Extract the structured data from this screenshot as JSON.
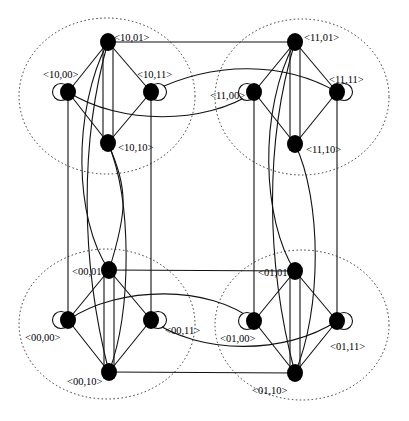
{
  "diagram": {
    "type": "hierarchical graph / hypercube-like network of 4 clusters",
    "colors": {
      "node": "#000000",
      "edge": "#111111",
      "cluster_boundary": "#333333",
      "background": "#ffffff"
    },
    "clusters": [
      {
        "id": "10",
        "position": "top-left",
        "cx": 107,
        "cy": 96,
        "rx": 88,
        "ry": 78
      },
      {
        "id": "11",
        "position": "top-right",
        "cx": 302,
        "cy": 97,
        "rx": 87,
        "ry": 78
      },
      {
        "id": "00",
        "position": "bottom-left",
        "cx": 107,
        "cy": 324,
        "rx": 88,
        "ry": 75
      },
      {
        "id": "01",
        "position": "bottom-right",
        "cx": 302,
        "cy": 325,
        "rx": 87,
        "ry": 75
      }
    ],
    "nodes": [
      {
        "id": "10,01",
        "label": "<10,01>",
        "x": 108,
        "y": 42,
        "lx": 114,
        "ly": 37,
        "loop": null
      },
      {
        "id": "10,00",
        "label": "<10,00>",
        "x": 68,
        "y": 92,
        "lx": 43,
        "ly": 74,
        "loop": "left"
      },
      {
        "id": "10,11",
        "label": "<10,11>",
        "x": 151,
        "y": 92,
        "lx": 137,
        "ly": 74,
        "loop": "right"
      },
      {
        "id": "10,10",
        "label": "<10,10>",
        "x": 108,
        "y": 143,
        "lx": 118,
        "ly": 147,
        "loop": null
      },
      {
        "id": "11,01",
        "label": "<11,01>",
        "x": 295,
        "y": 42,
        "lx": 304,
        "ly": 37,
        "loop": null
      },
      {
        "id": "11,00",
        "label": "<11,00>",
        "x": 254,
        "y": 92,
        "lx": 210,
        "ly": 95,
        "loop": "left"
      },
      {
        "id": "11,11",
        "label": "<11,11>",
        "x": 337,
        "y": 92,
        "lx": 329,
        "ly": 79,
        "loop": "right"
      },
      {
        "id": "11,10",
        "label": "<11,10>",
        "x": 295,
        "y": 144,
        "lx": 306,
        "ly": 149,
        "loop": null
      },
      {
        "id": "00,01",
        "label": "<00,01>",
        "x": 109,
        "y": 270,
        "lx": 72,
        "ly": 271,
        "loop": null
      },
      {
        "id": "00,00",
        "label": "<00,00>",
        "x": 68,
        "y": 320,
        "lx": 25,
        "ly": 337,
        "loop": "left"
      },
      {
        "id": "00,11",
        "label": "<00,11>",
        "x": 151,
        "y": 320,
        "lx": 165,
        "ly": 330,
        "loop": "right"
      },
      {
        "id": "00,10",
        "label": "<00,10>",
        "x": 109,
        "y": 372,
        "lx": 67,
        "ly": 381,
        "loop": null
      },
      {
        "id": "01,01",
        "label": "<01,01>",
        "x": 295,
        "y": 271,
        "lx": 258,
        "ly": 272,
        "loop": null
      },
      {
        "id": "01,00",
        "label": "<01,00>",
        "x": 254,
        "y": 321,
        "lx": 220,
        "ly": 338,
        "loop": "left"
      },
      {
        "id": "01,11",
        "label": "<01,11>",
        "x": 337,
        "y": 321,
        "lx": 330,
        "ly": 346,
        "loop": "right"
      },
      {
        "id": "01,10",
        "label": "<01,10>",
        "x": 295,
        "y": 373,
        "lx": 252,
        "ly": 390,
        "loop": null
      }
    ],
    "edges": [
      {
        "from": "10,01",
        "to": "10,00",
        "d": "M108,42 L68,92"
      },
      {
        "from": "10,01",
        "to": "10,11",
        "d": "M108,42 L151,92"
      },
      {
        "from": "10,10",
        "to": "10,00",
        "d": "M108,143 L68,92"
      },
      {
        "from": "10,10",
        "to": "10,11",
        "d": "M108,143 L151,92"
      },
      {
        "from": "10,01",
        "to": "10,10",
        "d": "M103,45 L103,140"
      },
      {
        "from": "10,01",
        "to": "10,10",
        "d": "M113,45 L113,140"
      },
      {
        "from": "11,01",
        "to": "11,00",
        "d": "M295,42 L254,92"
      },
      {
        "from": "11,01",
        "to": "11,11",
        "d": "M295,42 L337,92"
      },
      {
        "from": "11,10",
        "to": "11,00",
        "d": "M295,144 L254,92"
      },
      {
        "from": "11,10",
        "to": "11,11",
        "d": "M295,144 L337,92"
      },
      {
        "from": "11,01",
        "to": "11,10",
        "d": "M290,45 L290,141"
      },
      {
        "from": "11,01",
        "to": "11,10",
        "d": "M300,45 L300,141"
      },
      {
        "from": "00,01",
        "to": "00,00",
        "d": "M109,270 L68,320"
      },
      {
        "from": "00,01",
        "to": "00,11",
        "d": "M109,270 L151,320"
      },
      {
        "from": "00,10",
        "to": "00,00",
        "d": "M109,372 L68,320"
      },
      {
        "from": "00,10",
        "to": "00,11",
        "d": "M109,372 L151,320"
      },
      {
        "from": "00,01",
        "to": "00,10",
        "d": "M104,273 L104,369"
      },
      {
        "from": "00,01",
        "to": "00,10",
        "d": "M114,273 L114,369"
      },
      {
        "from": "01,01",
        "to": "01,00",
        "d": "M295,271 L254,321"
      },
      {
        "from": "01,01",
        "to": "01,11",
        "d": "M295,271 L337,321"
      },
      {
        "from": "01,10",
        "to": "01,00",
        "d": "M295,373 L254,321"
      },
      {
        "from": "01,10",
        "to": "01,11",
        "d": "M295,373 L337,321"
      },
      {
        "from": "01,01",
        "to": "01,10",
        "d": "M290,274 L290,370"
      },
      {
        "from": "01,01",
        "to": "01,10",
        "d": "M300,274 L300,370"
      },
      {
        "from": "10,01",
        "to": "11,01",
        "d": "M108,42 L295,42"
      },
      {
        "from": "10,11",
        "to": "11,11",
        "d": "M151,92 C215,60 285,62 337,92"
      },
      {
        "from": "10,00",
        "to": "11,00",
        "d": "M68,92 C120,125 205,125 254,92"
      },
      {
        "from": "00,01",
        "to": "01,01",
        "d": "M109,270 L295,271"
      },
      {
        "from": "00,10",
        "to": "01,10",
        "d": "M109,372 L295,373"
      },
      {
        "from": "00,00",
        "to": "01,00",
        "d": "M68,320 C120,285 210,285 254,321"
      },
      {
        "from": "00,11",
        "to": "01,11",
        "d": "M151,320 C200,355 285,355 337,321"
      },
      {
        "from": "10,00",
        "to": "00,00",
        "d": "M68,92 L68,320"
      },
      {
        "from": "10,11",
        "to": "00,11",
        "d": "M151,92 L151,320"
      },
      {
        "from": "10,01",
        "to": "00,01",
        "d": "M108,42 C72,110 74,220 109,270"
      },
      {
        "from": "10,10",
        "to": "00,10",
        "d": "M108,143 C132,200 132,310 109,372"
      },
      {
        "from": "10,01",
        "to": "00,10",
        "d": "M108,42 C80,140 80,260 109,372"
      },
      {
        "from": "11,00",
        "to": "01,00",
        "d": "M254,92 L254,321"
      },
      {
        "from": "11,11",
        "to": "01,11",
        "d": "M337,92 L337,321"
      },
      {
        "from": "11,01",
        "to": "01,01",
        "d": "M295,42 C258,110 262,220 295,271"
      },
      {
        "from": "11,10",
        "to": "01,10",
        "d": "M295,144 C322,200 322,310 295,373"
      },
      {
        "from": "00,01",
        "to": "10,10",
        "d": "M109,270 C128,210 128,190 108,143"
      },
      {
        "from": "11,01",
        "to": "01,10",
        "d": "M295,42 C265,140 265,260 295,373"
      }
    ]
  }
}
